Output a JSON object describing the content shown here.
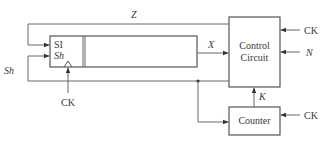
{
  "diagram": {
    "type": "block-diagram",
    "colors": {
      "stroke": "#555555",
      "text": "#3a3a3a",
      "background": "#ffffff"
    },
    "blocks": {
      "shift_register": {
        "inputs": {
          "si_label": "SI",
          "sh_label": "Sh"
        }
      },
      "control_circuit": {
        "line1": "Control",
        "line2": "Circuit"
      },
      "counter": {
        "label": "Counter"
      }
    },
    "signals": {
      "z": "Z",
      "x": "X",
      "sh": "Sh",
      "k": "K",
      "n": "N",
      "ck_register": "CK",
      "ck_control": "CK",
      "ck_counter": "CK"
    }
  }
}
